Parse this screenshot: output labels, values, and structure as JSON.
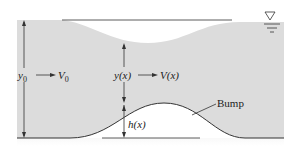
{
  "diagram": {
    "labels": {
      "upstream_depth": "y",
      "upstream_depth_sub": "0",
      "upstream_velocity": "V",
      "upstream_velocity_sub": "0",
      "local_depth": "y(x)",
      "local_velocity": "V(x)",
      "bump_height": "h(x)",
      "bump": "Bump"
    },
    "free_surface_symbol": "free-surface-triangle",
    "colors": {
      "water": "#dcdcdc",
      "line": "#333333",
      "background": "#ffffff"
    }
  }
}
